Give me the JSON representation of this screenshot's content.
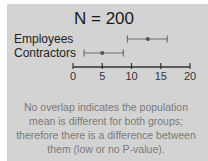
{
  "chart_data": {
    "type": "interval",
    "title": "N = 200",
    "categories": [
      "Employees",
      "Contractors"
    ],
    "series": [
      {
        "name": "Employees",
        "low": 9.3,
        "mean": 12.8,
        "high": 16.1
      },
      {
        "name": "Contractors",
        "low": 1.9,
        "mean": 5.0,
        "high": 8.6
      }
    ],
    "xlabel": "",
    "ylabel": "",
    "xlim": [
      0,
      20
    ],
    "x_ticks": [
      "0",
      "5",
      "10",
      "15",
      "20"
    ],
    "grid": false,
    "annotation": "No overlap indicates the population mean is different for both groups; therefore there is a difference between them (low or no P-value)."
  },
  "colors": {
    "panel": "#d3d3d3",
    "interval": "#6e6e6e",
    "axis": "#333333",
    "caption": "#7a7a7a"
  }
}
